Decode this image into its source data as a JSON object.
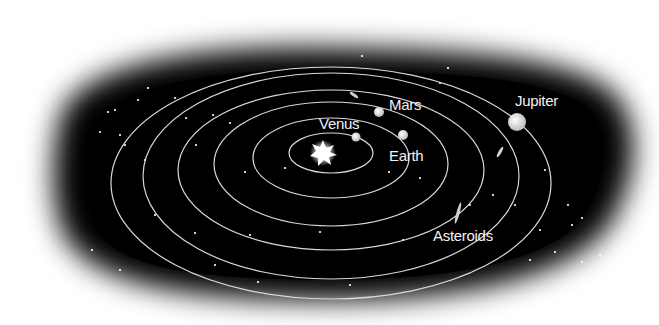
{
  "diagram": {
    "background_color": "#000000",
    "orbit_color": "#d9d9d9",
    "center": {
      "x": 331,
      "y": 195
    },
    "sun": {
      "x": 323,
      "y": 153,
      "label": ""
    },
    "orbits": [
      {
        "name": "mercury-orbit",
        "rx": 42,
        "ry": 20,
        "cy": 153
      },
      {
        "name": "venus-orbit",
        "rx": 78,
        "ry": 40,
        "cy": 158
      },
      {
        "name": "earth-orbit",
        "rx": 117,
        "ry": 62,
        "cy": 164
      },
      {
        "name": "mars-orbit",
        "rx": 153,
        "ry": 80,
        "cy": 170
      },
      {
        "name": "asteroid-belt-orbit",
        "rx": 188,
        "ry": 103,
        "cy": 176
      },
      {
        "name": "jupiter-orbit",
        "rx": 220,
        "ry": 116,
        "cy": 183
      }
    ],
    "bodies": [
      {
        "name": "venus",
        "label": "Venus",
        "x": 356,
        "y": 137,
        "r": 4.5,
        "label_x": 319,
        "label_y": 129
      },
      {
        "name": "earth",
        "label": "Earth",
        "x": 403,
        "y": 135,
        "r": 5,
        "label_x": 389,
        "label_y": 160
      },
      {
        "name": "mars",
        "label": "Mars",
        "x": 379,
        "y": 112,
        "r": 5,
        "label_x": 389,
        "label_y": 110
      },
      {
        "name": "jupiter",
        "label": "Jupiter",
        "x": 517,
        "y": 122,
        "r": 9,
        "label_x": 515,
        "label_y": 106
      }
    ],
    "asteroids": [
      {
        "x": 354,
        "y": 95,
        "rot": 35,
        "len": 5
      },
      {
        "x": 500,
        "y": 152,
        "rot": -60,
        "len": 6
      },
      {
        "x": 458,
        "y": 213,
        "rot": -75,
        "len": 11
      }
    ],
    "labels": {
      "asteroids": {
        "text": "Asteroids",
        "x": 433,
        "y": 241
      },
      "venus": "Venus",
      "earth": "Earth",
      "mars": "Mars",
      "jupiter": "Jupiter"
    }
  }
}
